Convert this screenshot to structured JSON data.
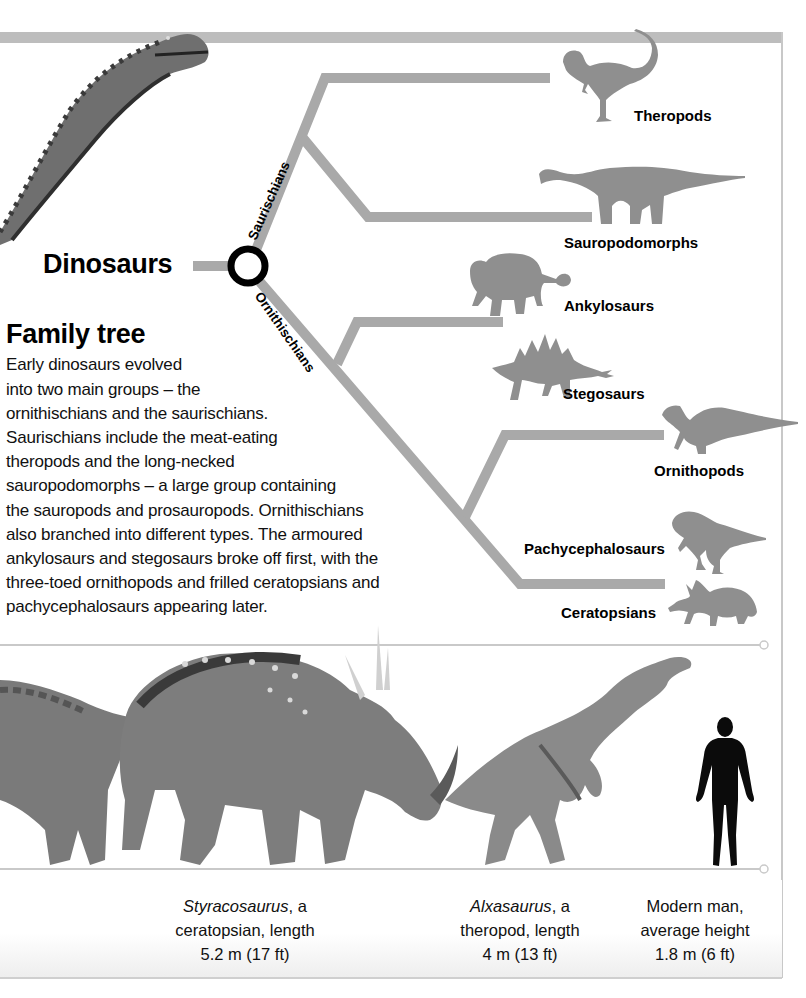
{
  "tree": {
    "root_label": "Dinosaurs",
    "clades": {
      "saurischians": "Saurischians",
      "ornithischians": "Ornithischians"
    },
    "groups": [
      {
        "id": "theropods",
        "label": "Theropods"
      },
      {
        "id": "sauropodomorphs",
        "label": "Sauropodomorphs"
      },
      {
        "id": "ankylosaurs",
        "label": "Ankylosaurs"
      },
      {
        "id": "stegosaurs",
        "label": "Stegosaurs"
      },
      {
        "id": "ornithopods",
        "label": "Ornithopods"
      },
      {
        "id": "pachycephalosaurs",
        "label": "Pachycephalosaurs"
      },
      {
        "id": "ceratopsians",
        "label": "Ceratopsians"
      }
    ],
    "colors": {
      "branch": "#a9a9a9",
      "silhouette": "#8f8f8f",
      "root_ring": "#000000"
    }
  },
  "article": {
    "title": "Family tree",
    "lines": [
      "Early dinosaurs evolved",
      "into two main groups – the",
      "ornithischians and the saurischians.",
      "Saurischians include the meat-eating",
      "theropods and the long-necked",
      "sauropodomorphs – a large group containing",
      "the sauropods and prosauropods. Ornithischians",
      "also branched into different types. The armoured",
      "ankylosaurs and stegosaurs broke off first, with the",
      "three-toed ornithopods and frilled ceratopsians and",
      "pachycephalosaurs appearing later."
    ]
  },
  "scale_comparison": {
    "captions": [
      {
        "name_italic": "Styracosaurus",
        "name_rest": ", a",
        "line2": "ceratopsian, length",
        "line3": "5.2 m (17 ft)"
      },
      {
        "name_italic": "Alxasaurus",
        "name_rest": ", a",
        "line2": "theropod, length",
        "line3": "4 m (13 ft)"
      },
      {
        "name_italic": "",
        "name_rest": "Modern man,",
        "line2": "average height",
        "line3": "1.8 m (6 ft)"
      }
    ]
  }
}
